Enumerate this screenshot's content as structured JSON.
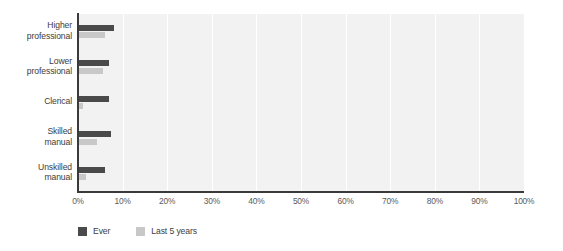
{
  "chart_data": {
    "type": "bar",
    "orientation": "horizontal",
    "title": "",
    "subtitle": "",
    "xlabel": "",
    "ylabel": "",
    "categories": [
      "Higher professional",
      "Lower professional",
      "Clerical",
      "Skilled manual",
      "Unskilled manual"
    ],
    "category_lines": [
      [
        "Higher",
        "professional"
      ],
      [
        "Lower",
        "professional"
      ],
      [
        "Clerical"
      ],
      [
        "Skilled",
        "manual"
      ],
      [
        "Unskilled",
        "manual"
      ]
    ],
    "series": [
      {
        "name": "Ever",
        "color": "#4a4a4a",
        "values": [
          8.0,
          6.9,
          6.9,
          7.5,
          6.0
        ]
      },
      {
        "name": "Last 5 years",
        "color": "#c8c8c8",
        "values": [
          6.0,
          5.5,
          1.1,
          4.2,
          1.8
        ]
      }
    ],
    "xlim": [
      0,
      100
    ],
    "xtick_values": [
      0,
      10,
      20,
      30,
      40,
      50,
      60,
      70,
      80,
      90,
      100
    ],
    "xtick_labels": [
      "0%",
      "10%",
      "20%",
      "30%",
      "40%",
      "50%",
      "60%",
      "70%",
      "80%",
      "90%",
      "100%"
    ],
    "grid": {
      "vertical": true,
      "horizontal": false,
      "color": "#ffffff"
    },
    "legend_position": "bottom-left",
    "plot_background": "#f2f2f2",
    "axis_color": "#3a3a3a"
  },
  "legend": {
    "items": [
      {
        "label": "Ever",
        "color": "#4a4a4a"
      },
      {
        "label": "Last 5 years",
        "color": "#c8c8c8"
      }
    ]
  }
}
